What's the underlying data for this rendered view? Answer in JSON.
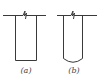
{
  "figure": {
    "panels": [
      {
        "id": "a",
        "label": "(a)",
        "bottom_shape": "flat"
      },
      {
        "id": "b",
        "label": "(b)",
        "bottom_shape": "rounded"
      }
    ],
    "colors": {
      "line": "#3a3a3a",
      "background": "#ffffff"
    }
  }
}
